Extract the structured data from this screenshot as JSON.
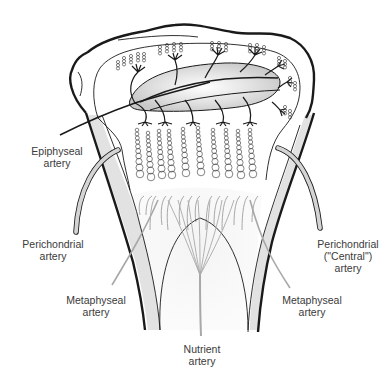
{
  "diagram": {
    "colors": {
      "outline": "#1a1a1a",
      "vessel_gray": "#a8a8a8",
      "cortex_fill": "#e2e2e2",
      "ossification_center_fill": "#cfcfcf",
      "text": "#3a3a3a",
      "background": "#ffffff"
    },
    "labels": {
      "epiphyseal": {
        "line1": "Epiphyseal",
        "line2": "artery"
      },
      "perichondrial_left": {
        "line1": "Perichondrial",
        "line2": "artery"
      },
      "perichondrial_right": {
        "line1": "Perichondrial",
        "line2": "(\"Central\")",
        "line3": "artery"
      },
      "metaphyseal_left": {
        "line1": "Metaphyseal",
        "line2": "artery"
      },
      "metaphyseal_right": {
        "line1": "Metaphyseal",
        "line2": "artery"
      },
      "nutrient": {
        "line1": "Nutrient",
        "line2": "artery"
      }
    },
    "structures": [
      "Epiphysis outline",
      "Secondary ossification center",
      "Epiphyseal artery branches with cartilage cell clusters",
      "Chondrocyte columns (10)",
      "Metaphyseal vascular loops",
      "Cortical bone shaft (left and right)",
      "Primary spongiosa arch",
      "Nutrient artery with branching fan"
    ],
    "chondrocyte_column_count": 10
  }
}
